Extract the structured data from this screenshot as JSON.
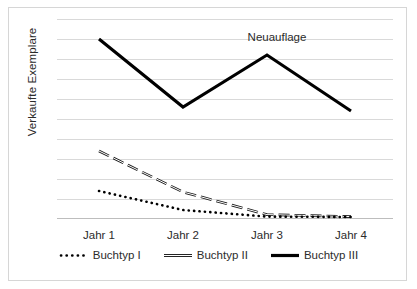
{
  "chart_data": {
    "type": "line",
    "title": "",
    "xlabel": "",
    "ylabel": "Verkaufte Exemplare",
    "categories": [
      "Jahr 1",
      "Jahr 2",
      "Jahr 3",
      "Jahr 4"
    ],
    "grid": true,
    "gridline_count": 10,
    "ylim": [
      0,
      10
    ],
    "y_ticklabels": [],
    "legend_position": "bottom",
    "annotations": [
      {
        "text": "Neuauflage",
        "x": "Jahr 3",
        "y": 9.2
      }
    ],
    "series": [
      {
        "name": "Buchtyp I",
        "style": "dotted",
        "color": "#000000",
        "x": [
          "Jahr 1",
          "Jahr 2",
          "Jahr 3",
          "Jahr 4"
        ],
        "values": [
          1.4,
          0.45,
          0.12,
          0.1
        ]
      },
      {
        "name": "Buchtyp II",
        "style": "dashed",
        "color": "#000000",
        "x": [
          "Jahr 1",
          "Jahr 2",
          "Jahr 3",
          "Jahr 4"
        ],
        "values": [
          3.4,
          1.35,
          0.22,
          0.12
        ]
      },
      {
        "name": "Buchtyp III",
        "style": "solid",
        "color": "#000000",
        "x": [
          "Jahr 1",
          "Jahr 2",
          "Jahr 3",
          "Jahr 4"
        ],
        "values": [
          9.0,
          5.6,
          8.2,
          5.4
        ]
      }
    ]
  },
  "axis": {
    "y_title": "Verkaufte Exemplare",
    "x_ticks": [
      {
        "label": "Jahr 1"
      },
      {
        "label": "Jahr 2"
      },
      {
        "label": "Jahr 3"
      },
      {
        "label": "Jahr 4"
      }
    ]
  },
  "annotation": {
    "neuauflage": "Neuauflage"
  },
  "legend": {
    "items": [
      {
        "label": "Buchtyp I",
        "marker": "dotted-line-icon"
      },
      {
        "label": "Buchtyp II",
        "marker": "dashed-line-icon"
      },
      {
        "label": "Buchtyp III",
        "marker": "solid-line-icon"
      }
    ]
  },
  "colors": {
    "series": "#000000",
    "grid": "#d9d9d9",
    "frame": "#d6d6d6",
    "text": "#2b2b2b",
    "background": "#ffffff"
  }
}
